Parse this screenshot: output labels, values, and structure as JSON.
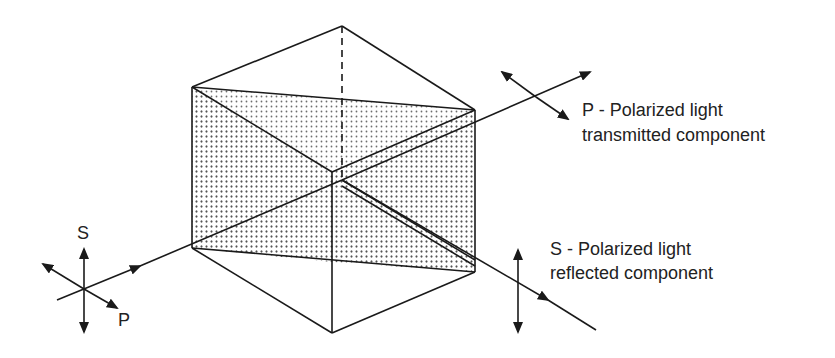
{
  "labels": {
    "transmitted_line1": "P - Polarized light",
    "transmitted_line2": "transmitted component",
    "reflected_line1": "S - Polarized light",
    "reflected_line2": "reflected component",
    "input_s": "S",
    "input_p": "P"
  },
  "colors": {
    "line": "#1a1a1a",
    "stipple": "#555555",
    "text": "#222222"
  }
}
